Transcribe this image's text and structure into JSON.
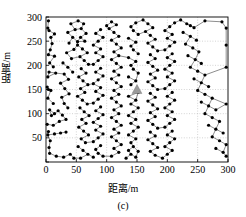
{
  "figure": {
    "caption": "(c)",
    "xlabel": "距离/m",
    "ylabel": "距离/m"
  },
  "chart_data": {
    "type": "scatter",
    "title": "",
    "subtitle": "",
    "caption": "(c)",
    "xlabel": "距离/m",
    "ylabel": "距离/m",
    "xlim": [
      0,
      300
    ],
    "ylim": [
      0,
      300
    ],
    "xticks": [
      0,
      50,
      100,
      150,
      200,
      250,
      300
    ],
    "yticks": [
      0,
      50,
      100,
      150,
      200,
      250,
      300
    ],
    "xticklabels": [
      "0",
      "50",
      "100",
      "150",
      "200",
      "250",
      "300"
    ],
    "yticklabels": [
      "",
      "50",
      "100",
      "150",
      "200",
      "250",
      "300"
    ],
    "grid": true,
    "grid_style": "dotted",
    "legend": null,
    "legend_position": "none",
    "marker": "filled-circle",
    "marker_color": "#000000",
    "marker_size_px": 3.2,
    "line_color": "#1a1a1a",
    "line_width_px": 0.5,
    "annotations": [
      {
        "name": "sink-node",
        "x": 150,
        "y": 150,
        "marker": "filled-triangle",
        "color": "#9a9a9a",
        "size_px": 9
      }
    ],
    "series": [
      {
        "name": "sensor-nodes",
        "points": [
          [
            4,
            292
          ],
          [
            3,
            277
          ],
          [
            5,
            272
          ],
          [
            14,
            265
          ],
          [
            8,
            258
          ],
          [
            10,
            245
          ],
          [
            7,
            232
          ],
          [
            4,
            222
          ],
          [
            14,
            219
          ],
          [
            6,
            205
          ],
          [
            12,
            197
          ],
          [
            5,
            186
          ],
          [
            16,
            184
          ],
          [
            3,
            176
          ],
          [
            2,
            155
          ],
          [
            4,
            150
          ],
          [
            8,
            148
          ],
          [
            3,
            132
          ],
          [
            12,
            121
          ],
          [
            6,
            108
          ],
          [
            14,
            100
          ],
          [
            9,
            96
          ],
          [
            2,
            78
          ],
          [
            12,
            76
          ],
          [
            4,
            63
          ],
          [
            3,
            56
          ],
          [
            14,
            58
          ],
          [
            24,
            60
          ],
          [
            33,
            62
          ],
          [
            7,
            44
          ],
          [
            5,
            30
          ],
          [
            6,
            18
          ],
          [
            17,
            12
          ],
          [
            29,
            10
          ],
          [
            40,
            16
          ],
          [
            46,
            8
          ],
          [
            22,
            84
          ],
          [
            33,
            88
          ],
          [
            27,
            97
          ],
          [
            20,
            106
          ],
          [
            36,
            112
          ],
          [
            30,
            121
          ],
          [
            26,
            134
          ],
          [
            38,
            141
          ],
          [
            31,
            152
          ],
          [
            24,
            163
          ],
          [
            37,
            171
          ],
          [
            30,
            182
          ],
          [
            44,
            186
          ],
          [
            36,
            196
          ],
          [
            28,
            205
          ],
          [
            42,
            214
          ],
          [
            34,
            226
          ],
          [
            46,
            233
          ],
          [
            38,
            246
          ],
          [
            52,
            249
          ],
          [
            44,
            258
          ],
          [
            36,
            268
          ],
          [
            48,
            274
          ],
          [
            41,
            286
          ],
          [
            53,
            292
          ],
          [
            62,
            286
          ],
          [
            58,
            276
          ],
          [
            66,
            266
          ],
          [
            57,
            258
          ],
          [
            64,
            250
          ],
          [
            52,
            242
          ],
          [
            60,
            234
          ],
          [
            68,
            226
          ],
          [
            56,
            218
          ],
          [
            63,
            210
          ],
          [
            70,
            202
          ],
          [
            58,
            193
          ],
          [
            66,
            184
          ],
          [
            54,
            176
          ],
          [
            61,
            168
          ],
          [
            69,
            160
          ],
          [
            57,
            152
          ],
          [
            64,
            144
          ],
          [
            52,
            136
          ],
          [
            60,
            128
          ],
          [
            68,
            120
          ],
          [
            56,
            112
          ],
          [
            63,
            104
          ],
          [
            71,
            96
          ],
          [
            59,
            88
          ],
          [
            66,
            80
          ],
          [
            54,
            72
          ],
          [
            62,
            64
          ],
          [
            70,
            56
          ],
          [
            58,
            48
          ],
          [
            65,
            40
          ],
          [
            53,
            32
          ],
          [
            61,
            24
          ],
          [
            69,
            16
          ],
          [
            57,
            8
          ],
          [
            78,
            10
          ],
          [
            86,
            18
          ],
          [
            94,
            12
          ],
          [
            82,
            26
          ],
          [
            90,
            34
          ],
          [
            78,
            42
          ],
          [
            86,
            50
          ],
          [
            94,
            58
          ],
          [
            82,
            66
          ],
          [
            90,
            74
          ],
          [
            78,
            82
          ],
          [
            86,
            90
          ],
          [
            94,
            98
          ],
          [
            82,
            106
          ],
          [
            90,
            114
          ],
          [
            78,
            122
          ],
          [
            86,
            130
          ],
          [
            94,
            138
          ],
          [
            82,
            146
          ],
          [
            90,
            154
          ],
          [
            78,
            162
          ],
          [
            86,
            170
          ],
          [
            94,
            178
          ],
          [
            82,
            186
          ],
          [
            90,
            194
          ],
          [
            78,
            202
          ],
          [
            86,
            210
          ],
          [
            94,
            218
          ],
          [
            82,
            226
          ],
          [
            90,
            234
          ],
          [
            78,
            242
          ],
          [
            86,
            250
          ],
          [
            94,
            258
          ],
          [
            82,
            266
          ],
          [
            90,
            274
          ],
          [
            100,
            282
          ],
          [
            108,
            290
          ],
          [
            116,
            284
          ],
          [
            104,
            276
          ],
          [
            112,
            268
          ],
          [
            120,
            260
          ],
          [
            108,
            252
          ],
          [
            116,
            244
          ],
          [
            124,
            236
          ],
          [
            112,
            228
          ],
          [
            120,
            220
          ],
          [
            108,
            212
          ],
          [
            116,
            204
          ],
          [
            124,
            196
          ],
          [
            112,
            188
          ],
          [
            120,
            180
          ],
          [
            108,
            172
          ],
          [
            116,
            164
          ],
          [
            124,
            156
          ],
          [
            112,
            148
          ],
          [
            120,
            140
          ],
          [
            108,
            132
          ],
          [
            116,
            124
          ],
          [
            124,
            116
          ],
          [
            112,
            108
          ],
          [
            120,
            100
          ],
          [
            108,
            92
          ],
          [
            116,
            84
          ],
          [
            124,
            76
          ],
          [
            112,
            68
          ],
          [
            120,
            60
          ],
          [
            108,
            52
          ],
          [
            116,
            44
          ],
          [
            124,
            36
          ],
          [
            112,
            28
          ],
          [
            120,
            20
          ],
          [
            108,
            12
          ],
          [
            132,
            8
          ],
          [
            140,
            16
          ],
          [
            148,
            10
          ],
          [
            136,
            24
          ],
          [
            144,
            32
          ],
          [
            152,
            22
          ],
          [
            140,
            40
          ],
          [
            148,
            48
          ],
          [
            136,
            56
          ],
          [
            144,
            64
          ],
          [
            152,
            72
          ],
          [
            140,
            80
          ],
          [
            148,
            88
          ],
          [
            136,
            96
          ],
          [
            144,
            104
          ],
          [
            152,
            112
          ],
          [
            140,
            120
          ],
          [
            148,
            128
          ],
          [
            136,
            136
          ],
          [
            152,
            144
          ],
          [
            140,
            160
          ],
          [
            148,
            168
          ],
          [
            136,
            176
          ],
          [
            152,
            184
          ],
          [
            144,
            192
          ],
          [
            140,
            200
          ],
          [
            148,
            208
          ],
          [
            136,
            216
          ],
          [
            152,
            224
          ],
          [
            144,
            232
          ],
          [
            140,
            240
          ],
          [
            148,
            248
          ],
          [
            136,
            256
          ],
          [
            152,
            264
          ],
          [
            144,
            272
          ],
          [
            140,
            280
          ],
          [
            148,
            288
          ],
          [
            160,
            294
          ],
          [
            168,
            286
          ],
          [
            176,
            278
          ],
          [
            164,
            270
          ],
          [
            172,
            262
          ],
          [
            180,
            254
          ],
          [
            168,
            246
          ],
          [
            176,
            238
          ],
          [
            184,
            230
          ],
          [
            172,
            222
          ],
          [
            180,
            214
          ],
          [
            168,
            206
          ],
          [
            176,
            198
          ],
          [
            184,
            190
          ],
          [
            172,
            182
          ],
          [
            180,
            174
          ],
          [
            168,
            166
          ],
          [
            176,
            158
          ],
          [
            184,
            150
          ],
          [
            172,
            142
          ],
          [
            180,
            134
          ],
          [
            168,
            126
          ],
          [
            176,
            118
          ],
          [
            184,
            110
          ],
          [
            172,
            102
          ],
          [
            180,
            94
          ],
          [
            168,
            86
          ],
          [
            176,
            78
          ],
          [
            184,
            70
          ],
          [
            172,
            62
          ],
          [
            180,
            54
          ],
          [
            168,
            46
          ],
          [
            176,
            38
          ],
          [
            184,
            30
          ],
          [
            172,
            22
          ],
          [
            180,
            14
          ],
          [
            192,
            8
          ],
          [
            200,
            16
          ],
          [
            208,
            24
          ],
          [
            196,
            32
          ],
          [
            204,
            40
          ],
          [
            212,
            48
          ],
          [
            200,
            56
          ],
          [
            208,
            64
          ],
          [
            196,
            72
          ],
          [
            204,
            80
          ],
          [
            212,
            88
          ],
          [
            200,
            96
          ],
          [
            208,
            104
          ],
          [
            196,
            112
          ],
          [
            204,
            120
          ],
          [
            212,
            128
          ],
          [
            200,
            136
          ],
          [
            208,
            144
          ],
          [
            196,
            152
          ],
          [
            204,
            160
          ],
          [
            212,
            168
          ],
          [
            200,
            176
          ],
          [
            208,
            184
          ],
          [
            196,
            192
          ],
          [
            204,
            200
          ],
          [
            212,
            208
          ],
          [
            200,
            216
          ],
          [
            208,
            224
          ],
          [
            196,
            232
          ],
          [
            204,
            240
          ],
          [
            212,
            248
          ],
          [
            200,
            256
          ],
          [
            208,
            264
          ],
          [
            196,
            272
          ],
          [
            204,
            280
          ],
          [
            212,
            288
          ],
          [
            222,
            294
          ],
          [
            232,
            286
          ],
          [
            244,
            278
          ],
          [
            226,
            268
          ],
          [
            238,
            260
          ],
          [
            248,
            252
          ],
          [
            230,
            244
          ],
          [
            242,
            236
          ],
          [
            252,
            228
          ],
          [
            234,
            220
          ],
          [
            246,
            212
          ],
          [
            256,
            204
          ],
          [
            238,
            196
          ],
          [
            250,
            188
          ],
          [
            262,
            180
          ],
          [
            244,
            172
          ],
          [
            256,
            164
          ],
          [
            268,
            156
          ],
          [
            250,
            148
          ],
          [
            262,
            140
          ],
          [
            274,
            132
          ],
          [
            256,
            124
          ],
          [
            268,
            116
          ],
          [
            280,
            108
          ],
          [
            262,
            100
          ],
          [
            274,
            92
          ],
          [
            286,
            84
          ],
          [
            268,
            76
          ],
          [
            280,
            68
          ],
          [
            292,
            60
          ],
          [
            274,
            52
          ],
          [
            286,
            44
          ],
          [
            297,
            36
          ],
          [
            280,
            28
          ],
          [
            292,
            20
          ],
          [
            297,
            12
          ],
          [
            297,
            120
          ],
          [
            297,
            196
          ],
          [
            297,
            242
          ],
          [
            297,
            277
          ],
          [
            290,
            290
          ],
          [
            262,
            292
          ],
          [
            238,
            282
          ]
        ]
      }
    ]
  }
}
